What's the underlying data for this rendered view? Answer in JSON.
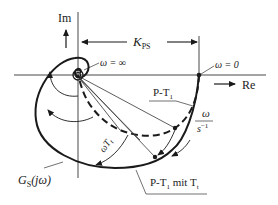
{
  "diagram": {
    "type": "nyquist-locus",
    "axes": {
      "imag_label": "Im",
      "real_label": "Re"
    },
    "gain_label": "K",
    "gain_sub": "PS",
    "omega_inf": "ω = ∞",
    "omega_zero": "ω = 0",
    "curve_pt1": "P-T",
    "curve_pt1_sub": "1",
    "curve_dead": "P-T",
    "curve_dead_sub": "1",
    "curve_dead_rest": " mit T",
    "curve_dead_rest_sub": "t",
    "freq_num": "ω",
    "freq_den": "s",
    "freq_den_exp": "−1",
    "phase_label": "ωT",
    "phase_sub": "t",
    "transfer_label": "G",
    "transfer_sub": "S",
    "transfer_arg": "(jω)",
    "colors": {
      "line": "#1a1a1a",
      "axis": "#333333"
    }
  }
}
